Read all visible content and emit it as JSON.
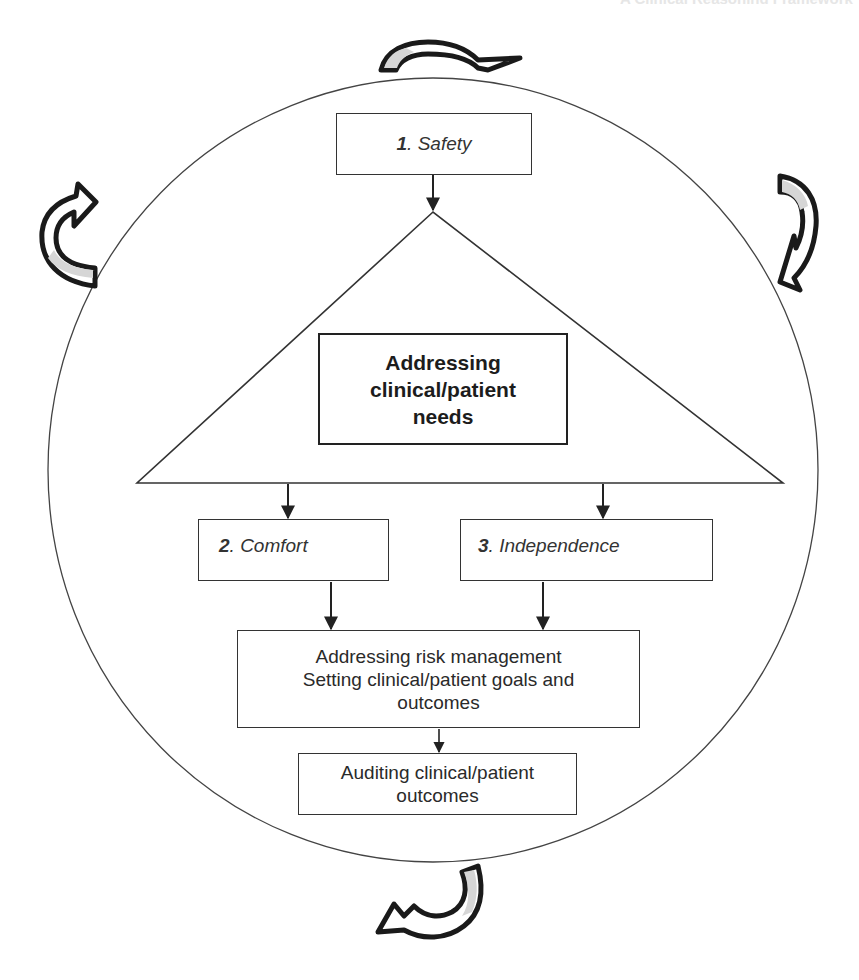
{
  "header": {
    "partial_text": "A Clinical Reasoning Framework"
  },
  "diagram": {
    "type": "cyclical flow diagram",
    "outer_cycle": {
      "shape": "circle",
      "arrows": [
        {
          "position": "top",
          "direction": "clockwise"
        },
        {
          "position": "right",
          "direction": "clockwise"
        },
        {
          "position": "bottom",
          "direction": "clockwise"
        },
        {
          "position": "left",
          "direction": "clockwise"
        }
      ]
    },
    "nodes": {
      "safety": {
        "number": "1",
        "label": ". Safety"
      },
      "core": {
        "lines": [
          "Addressing",
          "clinical/patient",
          "needs"
        ]
      },
      "comfort": {
        "number": "2",
        "label": ". Comfort"
      },
      "independence": {
        "number": "3",
        "label": ". Independence"
      },
      "risk": {
        "lines": [
          "Addressing risk management",
          "Setting clinical/patient goals and",
          "outcomes"
        ]
      },
      "auditing": {
        "lines": [
          "Auditing clinical/patient",
          "outcomes"
        ]
      }
    },
    "edges": [
      {
        "from": "safety",
        "to": "triangle-apex"
      },
      {
        "from": "triangle-base",
        "to": "comfort"
      },
      {
        "from": "triangle-base",
        "to": "independence"
      },
      {
        "from": "comfort",
        "to": "risk"
      },
      {
        "from": "independence",
        "to": "risk"
      },
      {
        "from": "risk",
        "to": "auditing"
      }
    ],
    "colors": {
      "line": "#333333",
      "arrow_outline": "#1a1a1a",
      "arrow_fill": "#ffffff",
      "arrow_shade": "#d6d6d6"
    }
  }
}
